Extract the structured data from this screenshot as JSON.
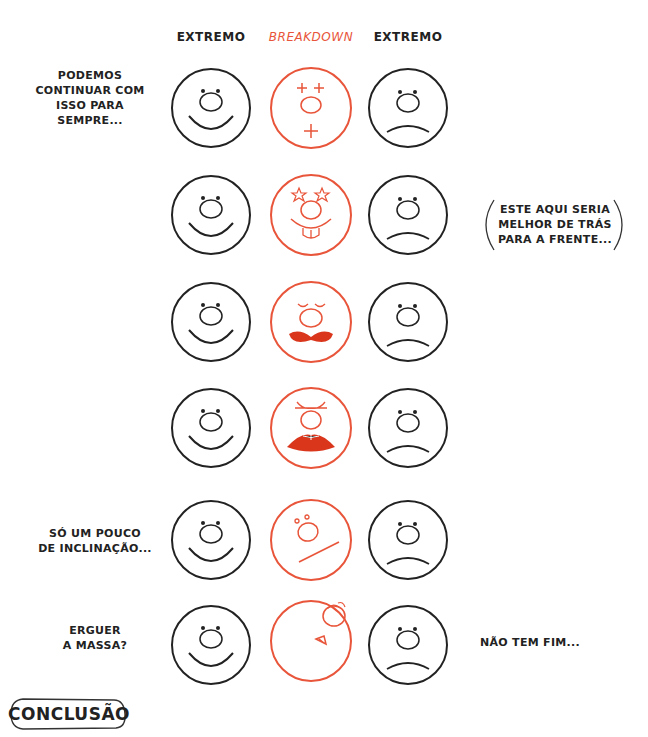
{
  "colors": {
    "ink": "#222222",
    "accent": "#e8553a",
    "background": "#ffffff"
  },
  "columns": [
    {
      "label": "EXTREMO",
      "style": "ink"
    },
    {
      "label": "BREAKDOWN",
      "style": "accent"
    },
    {
      "label": "EXTREMO",
      "style": "ink"
    }
  ],
  "rows": [
    {
      "left_note": [
        "PODEMOS",
        "CONTINUAR COM",
        "ISSO PARA",
        "SEMPRE..."
      ],
      "right_note": null,
      "left_face": "happy",
      "breakdown_face": "crosses-eyes-and-mouth",
      "right_face": "sad"
    },
    {
      "left_note": null,
      "right_note": [
        "ESTE AQUI SERIA",
        "MELHOR DE TRÁS",
        "PARA A FRENTE..."
      ],
      "left_face": "happy",
      "breakdown_face": "star-eyes-buck-teeth",
      "right_face": "sad"
    },
    {
      "left_note": null,
      "right_note": null,
      "left_face": "happy",
      "breakdown_face": "closed-eyes-bow-mouth",
      "right_face": "sad"
    },
    {
      "left_note": null,
      "right_note": null,
      "left_face": "happy",
      "breakdown_face": "squint-open-mouth",
      "right_face": "sad"
    },
    {
      "left_note": [
        "SÓ UM POUCO",
        "DE INCLINAÇÃO..."
      ],
      "right_note": null,
      "left_face": "happy",
      "breakdown_face": "tilted-line-mouth",
      "right_face": "sad"
    },
    {
      "left_note": [
        "ERGUER",
        "A MASSA?"
      ],
      "right_note": [
        "NÃO TEM FIM..."
      ],
      "left_face": "happy",
      "breakdown_face": "turned-away",
      "right_face": "sad"
    }
  ],
  "notes": {
    "row1": "PODEMOS CONTINUAR COM ISSO PARA SEMPRE...",
    "row2_bubble": "ESTE AQUI SERIA MELHOR DE TRÁS PARA A FRENTE...",
    "row5": "SÓ UM POUCO DE INCLINAÇÃO...",
    "row6_left": "ERGUER A MASSA?",
    "row6_right": "NÃO TEM FIM..."
  },
  "footer": {
    "label": "CONCLUSÃO"
  }
}
